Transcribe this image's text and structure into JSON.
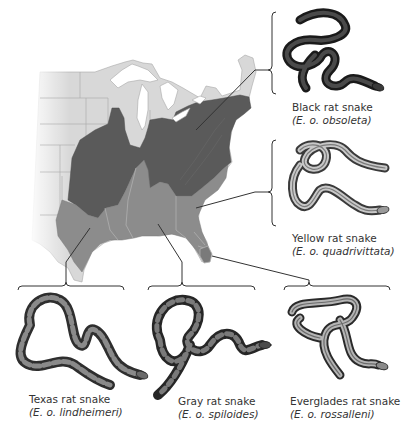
{
  "figure": {
    "type": "range map of rat snake subspecies (Elaphe obsoleta) in the eastern United States",
    "colors": {
      "background": "#ffffff",
      "map_land_outside_range": "#d9d9d9",
      "map_lakes": "#ffffff",
      "black_rat_snake_range": "#5a5a5a",
      "southern_subspecies_range": "#8c8c8c",
      "state_borders": "#a8a8a8",
      "connector_lines": "#333333"
    }
  },
  "subspecies": [
    {
      "id": "black",
      "common_name": "Black rat snake",
      "scientific_name": "(E. o. obsoleta)",
      "snake_color": "#2a2a2a",
      "pattern": "solid dark"
    },
    {
      "id": "yellow",
      "common_name": "Yellow rat snake",
      "scientific_name": "(E. o. quadrivittata)",
      "snake_color": "#9a9a9a",
      "pattern": "striped"
    },
    {
      "id": "texas",
      "common_name": "Texas rat snake",
      "scientific_name": "(E. o. lindheimeri)",
      "snake_color": "#6e6e6e",
      "pattern": "blotched"
    },
    {
      "id": "gray",
      "common_name": "Gray rat snake",
      "scientific_name": "(E. o. spiloides)",
      "snake_color": "#5c5c5c",
      "pattern": "blotched"
    },
    {
      "id": "everglades",
      "common_name": "Everglades rat snake",
      "scientific_name": "(E. o. rossalleni)",
      "snake_color": "#8a8a8a",
      "pattern": "striped"
    }
  ]
}
